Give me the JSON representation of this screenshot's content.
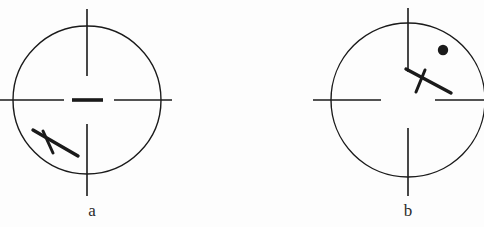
{
  "figure": {
    "type": "scanned-line-diagram",
    "background_color": "#fdfdfd",
    "stroke_color": "#1a1a1a",
    "width": 484,
    "height": 227
  },
  "panels": [
    {
      "id": "a",
      "label": "a",
      "circle": {
        "cx": 87,
        "cy": 100,
        "r": 74,
        "stroke_width": 1.4
      },
      "ticks": {
        "top": {
          "x": 87,
          "y1": 9,
          "y2": 76,
          "stroke_width": 1.6
        },
        "bottom": {
          "x": 87,
          "y1": 124,
          "y2": 196,
          "stroke_width": 1.6
        },
        "left": {
          "y": 100,
          "x1": 0,
          "x2": 64,
          "stroke_width": 1.6
        },
        "right": {
          "y": 100,
          "x1": 114,
          "x2": 172,
          "stroke_width": 1.6
        }
      },
      "center_bar": {
        "x1": 72,
        "x2": 103,
        "y": 100,
        "stroke_width": 3.6
      },
      "aircraft": {
        "fuselage": {
          "x1": 33,
          "y1": 130,
          "x2": 78,
          "y2": 156,
          "stroke_width": 3.4
        },
        "wing": {
          "x1": 43,
          "y1": 131,
          "x2": 53,
          "y2": 153,
          "stroke_width": 3.0
        }
      },
      "dot": null
    },
    {
      "id": "b",
      "label": "b",
      "circle": {
        "cx": 166,
        "cy": 100,
        "r": 77,
        "stroke_width": 1.4
      },
      "ticks": {
        "top": {
          "x": 166,
          "y1": 8,
          "y2": 72,
          "stroke_width": 1.6
        },
        "bottom": {
          "x": 166,
          "y1": 128,
          "y2": 196,
          "stroke_width": 1.6
        },
        "left": {
          "y": 100,
          "x1": 71,
          "x2": 139,
          "stroke_width": 1.6
        },
        "right": {
          "y": 100,
          "x1": 193,
          "x2": 242,
          "stroke_width": 1.6
        }
      },
      "center_bar": null,
      "aircraft": {
        "fuselage": {
          "x1": 164,
          "y1": 69,
          "x2": 209,
          "y2": 93,
          "stroke_width": 3.4
        },
        "wing": {
          "x1": 183,
          "y1": 70,
          "x2": 174,
          "y2": 92,
          "stroke_width": 3.0
        }
      },
      "dot": {
        "cx": 201,
        "cy": 50,
        "r": 5.2
      }
    }
  ]
}
